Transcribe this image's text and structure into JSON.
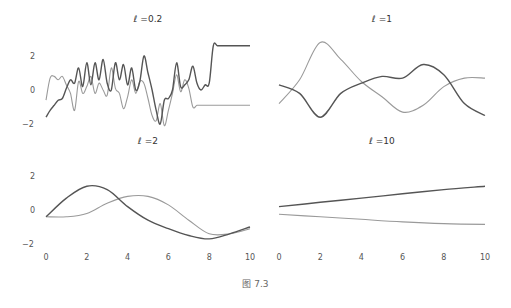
{
  "caption": "图 7.3",
  "colors": {
    "dark": "#555555",
    "light": "#9a9a9a"
  },
  "chart_data": [
    {
      "type": "line",
      "title": "ℓ =0.2",
      "xlabel": "",
      "ylabel": "",
      "xlim": [
        0,
        10
      ],
      "ylim": [
        -2.2,
        2.8
      ],
      "yticks": [
        2,
        0,
        -2
      ],
      "xticks": [],
      "grid": false,
      "x": [
        0,
        0.2,
        0.4,
        0.6,
        0.8,
        1.0,
        1.2,
        1.4,
        1.6,
        1.8,
        2.0,
        2.2,
        2.4,
        2.6,
        2.8,
        3.0,
        3.2,
        3.4,
        3.6,
        3.8,
        4.0,
        4.2,
        4.4,
        4.6,
        4.8,
        5.0,
        5.2,
        5.4,
        5.6,
        5.8,
        6.0,
        6.2,
        6.4,
        6.6,
        6.8,
        7.0,
        7.2,
        7.4,
        7.6,
        7.8,
        8.0,
        8.2,
        8.4,
        8.6,
        8.8,
        9.0,
        9.2,
        9.4,
        9.6,
        9.8,
        10.0
      ],
      "series": [
        {
          "name": "sample 1",
          "color": "dark",
          "values": [
            -1.6,
            -1.2,
            -0.9,
            -0.6,
            -0.5,
            0.1,
            0.6,
            0.4,
            1.3,
            0.2,
            1.6,
            0.3,
            1.6,
            0.6,
            1.8,
            0.4,
            0.0,
            1.6,
            0.6,
            1.5,
            0.3,
            1.3,
            0.0,
            0.5,
            2.0,
            1.0,
            0.0,
            -1.2,
            -2.0,
            -0.6,
            -0.5,
            0.0,
            1.6,
            0.2,
            0.3,
            0.6,
            1.4,
            0.4,
            0.0,
            0.3,
            0.4,
            2.6,
            2.6,
            2.6,
            2.6,
            2.6,
            2.6,
            2.6,
            2.6,
            2.6,
            2.6
          ]
        },
        {
          "name": "sample 2",
          "color": "light",
          "values": [
            -0.6,
            0.7,
            0.8,
            0.6,
            0.8,
            0.3,
            -0.2,
            -1.2,
            0.5,
            -0.2,
            0.2,
            0.8,
            -0.2,
            0.4,
            0.0,
            -0.3,
            1.3,
            0.1,
            -0.2,
            -1.1,
            -0.4,
            0.6,
            -0.2,
            0.5,
            0.4,
            -0.5,
            -1.5,
            -1.8,
            -0.8,
            -2.1,
            -1.2,
            -0.2,
            0.9,
            -0.1,
            0.6,
            0.1,
            -1.0,
            -0.9,
            -0.9,
            -0.9,
            -0.9,
            -0.9,
            -0.9,
            -0.9,
            -0.9,
            -0.9,
            -0.9,
            -0.9,
            -0.9,
            -0.9,
            -0.9
          ]
        }
      ]
    },
    {
      "type": "line",
      "title": "ℓ =1",
      "xlabel": "",
      "ylabel": "",
      "xlim": [
        0,
        10
      ],
      "ylim": [
        -2.2,
        2.8
      ],
      "yticks": [],
      "xticks": [],
      "grid": false,
      "x": [
        0,
        1,
        2,
        3,
        4,
        5,
        6,
        7,
        8,
        9,
        10
      ],
      "series": [
        {
          "name": "sample 1",
          "color": "dark",
          "values": [
            0.3,
            -0.2,
            -1.6,
            -0.2,
            0.4,
            0.8,
            0.7,
            1.5,
            0.9,
            -0.8,
            -1.5
          ]
        },
        {
          "name": "sample 2",
          "color": "light",
          "values": [
            -0.8,
            0.6,
            2.8,
            1.8,
            0.5,
            -0.4,
            -1.3,
            -0.9,
            0.2,
            0.7,
            0.7
          ]
        }
      ]
    },
    {
      "type": "line",
      "title": "ℓ =2",
      "xlabel": "",
      "ylabel": "",
      "xlim": [
        0,
        10
      ],
      "ylim": [
        -2.2,
        2.2
      ],
      "yticks": [
        2,
        0,
        -2
      ],
      "xticks": [
        0,
        2,
        4,
        6,
        8,
        10
      ],
      "grid": false,
      "x": [
        0,
        1,
        2,
        3,
        4,
        5,
        6,
        7,
        8,
        9,
        10
      ],
      "series": [
        {
          "name": "sample 1",
          "color": "dark",
          "values": [
            -0.4,
            0.7,
            1.4,
            1.2,
            0.2,
            -0.6,
            -1.1,
            -1.5,
            -1.7,
            -1.4,
            -1.0
          ]
        },
        {
          "name": "sample 2",
          "color": "light",
          "values": [
            -0.4,
            -0.4,
            -0.2,
            0.4,
            0.8,
            0.8,
            0.3,
            -0.6,
            -1.4,
            -1.4,
            -1.1
          ]
        }
      ]
    },
    {
      "type": "line",
      "title": "ℓ =10",
      "xlabel": "",
      "ylabel": "",
      "xlim": [
        0,
        10
      ],
      "ylim": [
        -2.2,
        2.2
      ],
      "yticks": [],
      "xticks": [
        0,
        2,
        4,
        6,
        8,
        10
      ],
      "grid": false,
      "x": [
        0,
        2,
        4,
        6,
        8,
        10
      ],
      "series": [
        {
          "name": "sample 1",
          "color": "dark",
          "values": [
            0.2,
            0.45,
            0.7,
            0.95,
            1.2,
            1.4
          ]
        },
        {
          "name": "sample 2",
          "color": "light",
          "values": [
            -0.25,
            -0.4,
            -0.55,
            -0.7,
            -0.8,
            -0.85
          ]
        }
      ]
    }
  ],
  "panels": [
    {
      "title": "ℓ =0.2",
      "ytick_labels": [
        "2",
        "0",
        "−2"
      ],
      "xtick_labels": []
    },
    {
      "title": "ℓ =1",
      "ytick_labels": [],
      "xtick_labels": []
    },
    {
      "title": "ℓ =2",
      "ytick_labels": [
        "2",
        "0",
        "−2"
      ],
      "xtick_labels": [
        "0",
        "2",
        "4",
        "6",
        "8",
        "10"
      ]
    },
    {
      "title": "ℓ =10",
      "ytick_labels": [],
      "xtick_labels": [
        "0",
        "2",
        "4",
        "6",
        "8",
        "10"
      ]
    }
  ]
}
